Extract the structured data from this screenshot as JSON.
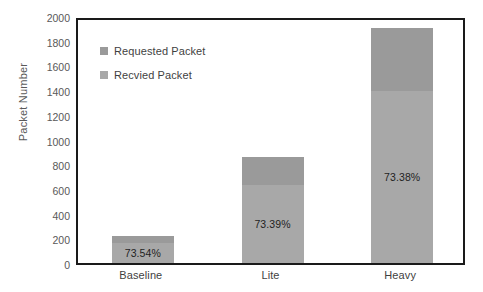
{
  "chart_data": {
    "type": "bar",
    "title": "",
    "xlabel": "",
    "ylabel": "Packet Number",
    "categories": [
      "Baseline",
      "Lite",
      "Heavy"
    ],
    "ylim": [
      0,
      2000
    ],
    "y_ticks": [
      "0",
      "200",
      "400",
      "600",
      "800",
      "1000",
      "1200",
      "1400",
      "1600",
      "1800",
      "2000"
    ],
    "y_tick_values": [
      0,
      200,
      400,
      600,
      800,
      1000,
      1200,
      1400,
      1600,
      1800,
      2000
    ],
    "grid": false,
    "stacked_overlay": true,
    "legend_position": "top-left-inside",
    "series": [
      {
        "name": "Requested Packet",
        "color": "#9a9a9a",
        "values": [
          220,
          860,
          1900
        ]
      },
      {
        "name": "Recvied Packet",
        "color": "#a8a8a8",
        "values": [
          162,
          631,
          1394
        ]
      }
    ],
    "annotations": [
      {
        "category": "Baseline",
        "text": "73.54%"
      },
      {
        "category": "Lite",
        "text": "73.39%"
      },
      {
        "category": "Heavy",
        "text": "73.38%"
      }
    ]
  },
  "legend": {
    "items": [
      {
        "label": "Requested Packet",
        "swatch": "#9a9a9a"
      },
      {
        "label": "Recvied Packet",
        "swatch": "#a8a8a8"
      }
    ]
  },
  "axis": {
    "y_title": "Packet Number"
  },
  "colors": {
    "requested": "#9a9a9a",
    "received": "#a8a8a8",
    "frame": "#1a1a1a",
    "tick_text": "#595959",
    "label_text": "#3f3f3f",
    "value_text": "#1f1f1f",
    "background": "#ffffff"
  }
}
